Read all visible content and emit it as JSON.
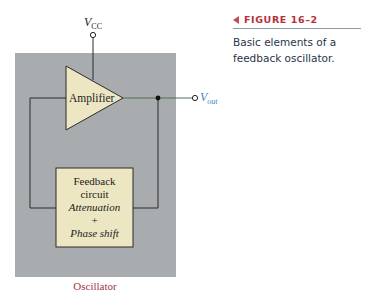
{
  "figure": {
    "label": "FIGURE 16–2",
    "caption": "Basic elements of a feedback oscillator.",
    "caption_lines": [
      "Basic elements of a feedback",
      "oscillator."
    ]
  },
  "diagram": {
    "supply_label": "V",
    "supply_subscript": "CC",
    "amplifier_label": "Amplifier",
    "output_label": "V",
    "output_subscript": "out",
    "feedback_lines": [
      "Feedback",
      "circuit",
      "Attenuation",
      "+",
      "Phase shift"
    ],
    "enclosure_label": "Oscillator",
    "colors": {
      "enclosure_fill": "#a9acae",
      "block_fill": "#ece6c2",
      "wire": "#2b2b2b",
      "output_wire": "#5c8a63",
      "output_label": "#4a7fc0",
      "enclosure_label": "#a3364a",
      "figure_label": "#b5313a"
    }
  }
}
